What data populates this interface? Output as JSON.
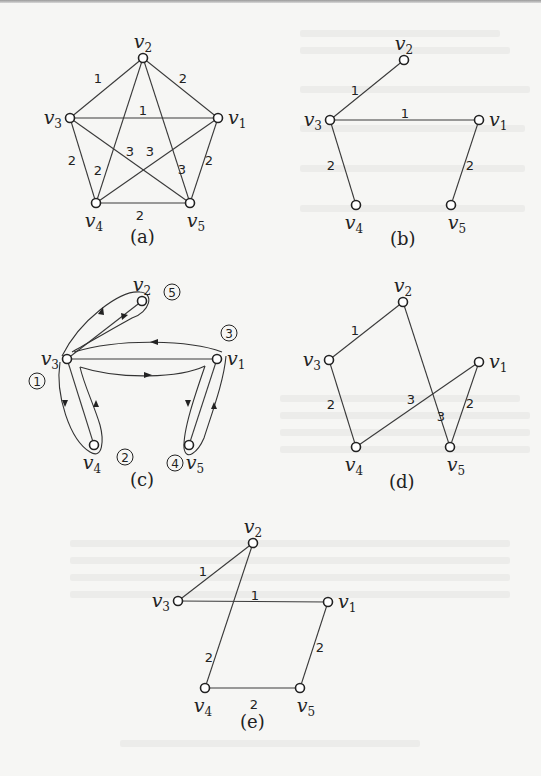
{
  "figure": {
    "panels": [
      {
        "id": "a",
        "caption": "(a)",
        "description": "Complete weighted graph K5",
        "nodes": [
          {
            "id": "v1",
            "label": "v",
            "sub": "1",
            "x": 218,
            "y": 118
          },
          {
            "id": "v2",
            "label": "v",
            "sub": "2",
            "x": 143,
            "y": 58
          },
          {
            "id": "v3",
            "label": "v",
            "sub": "3",
            "x": 70,
            "y": 118
          },
          {
            "id": "v4",
            "label": "v",
            "sub": "4",
            "x": 96,
            "y": 203
          },
          {
            "id": "v5",
            "label": "v",
            "sub": "5",
            "x": 190,
            "y": 203
          }
        ],
        "edges": [
          {
            "from": "v2",
            "to": "v3",
            "weight": "1"
          },
          {
            "from": "v2",
            "to": "v1",
            "weight": "2"
          },
          {
            "from": "v3",
            "to": "v1",
            "weight": "1"
          },
          {
            "from": "v3",
            "to": "v4",
            "weight": "2"
          },
          {
            "from": "v1",
            "to": "v5",
            "weight": "2"
          },
          {
            "from": "v4",
            "to": "v5",
            "weight": "2"
          },
          {
            "from": "v2",
            "to": "v4",
            "weight": "2"
          },
          {
            "from": "v2",
            "to": "v5",
            "weight": "3"
          },
          {
            "from": "v3",
            "to": "v5",
            "weight": "3"
          },
          {
            "from": "v1",
            "to": "v4",
            "weight": "3"
          }
        ]
      },
      {
        "id": "b",
        "caption": "(b)",
        "description": "Minimum spanning tree",
        "nodes": [
          {
            "id": "v1",
            "label": "v",
            "sub": "1",
            "x": 479,
            "y": 120
          },
          {
            "id": "v2",
            "label": "v",
            "sub": "2",
            "x": 404,
            "y": 60
          },
          {
            "id": "v3",
            "label": "v",
            "sub": "3",
            "x": 330,
            "y": 120
          },
          {
            "id": "v4",
            "label": "v",
            "sub": "4",
            "x": 356,
            "y": 205
          },
          {
            "id": "v5",
            "label": "v",
            "sub": "5",
            "x": 451,
            "y": 205
          }
        ],
        "edges": [
          {
            "from": "v3",
            "to": "v2",
            "weight": "1"
          },
          {
            "from": "v3",
            "to": "v1",
            "weight": "1"
          },
          {
            "from": "v3",
            "to": "v4",
            "weight": "2"
          },
          {
            "from": "v1",
            "to": "v5",
            "weight": "2"
          }
        ]
      },
      {
        "id": "c",
        "caption": "(c)",
        "description": "Euler tour around doubled spanning tree",
        "nodes": [
          {
            "id": "v1",
            "label": "v",
            "sub": "1",
            "x": 217,
            "y": 359
          },
          {
            "id": "v2",
            "label": "v",
            "sub": "2",
            "x": 142,
            "y": 301
          },
          {
            "id": "v3",
            "label": "v",
            "sub": "3",
            "x": 67,
            "y": 359
          },
          {
            "id": "v4",
            "label": "v",
            "sub": "4",
            "x": 94,
            "y": 445
          },
          {
            "id": "v5",
            "label": "v",
            "sub": "5",
            "x": 189,
            "y": 445
          }
        ],
        "edges": [
          {
            "from": "v3",
            "to": "v2",
            "weight": ""
          },
          {
            "from": "v3",
            "to": "v1",
            "weight": ""
          },
          {
            "from": "v3",
            "to": "v4",
            "weight": ""
          },
          {
            "from": "v1",
            "to": "v5",
            "weight": ""
          }
        ],
        "step_markers": [
          {
            "label": "1",
            "x": 37,
            "y": 381
          },
          {
            "label": "2",
            "x": 125,
            "y": 457
          },
          {
            "label": "3",
            "x": 229,
            "y": 333
          },
          {
            "label": "4",
            "x": 175,
            "y": 463
          },
          {
            "label": "5",
            "x": 172,
            "y": 292
          }
        ]
      },
      {
        "id": "d",
        "caption": "(d)",
        "description": "Hamiltonian cycle from shortcutting",
        "nodes": [
          {
            "id": "v1",
            "label": "v",
            "sub": "1",
            "x": 479,
            "y": 362
          },
          {
            "id": "v2",
            "label": "v",
            "sub": "2",
            "x": 403,
            "y": 302
          },
          {
            "id": "v3",
            "label": "v",
            "sub": "3",
            "x": 329,
            "y": 360
          },
          {
            "id": "v4",
            "label": "v",
            "sub": "4",
            "x": 356,
            "y": 447
          },
          {
            "id": "v5",
            "label": "v",
            "sub": "5",
            "x": 450,
            "y": 447
          }
        ],
        "edges": [
          {
            "from": "v3",
            "to": "v2",
            "weight": "1"
          },
          {
            "from": "v2",
            "to": "v5",
            "weight": "3"
          },
          {
            "from": "v5",
            "to": "v1",
            "weight": "2"
          },
          {
            "from": "v1",
            "to": "v4",
            "weight": "3"
          },
          {
            "from": "v4",
            "to": "v3",
            "weight": "2"
          }
        ]
      },
      {
        "id": "e",
        "caption": "(e)",
        "description": "Optimal tour",
        "nodes": [
          {
            "id": "v1",
            "label": "v",
            "sub": "1",
            "x": 328,
            "y": 602
          },
          {
            "id": "v2",
            "label": "v",
            "sub": "2",
            "x": 253,
            "y": 543
          },
          {
            "id": "v3",
            "label": "v",
            "sub": "3",
            "x": 178,
            "y": 601
          },
          {
            "id": "v4",
            "label": "v",
            "sub": "4",
            "x": 205,
            "y": 688
          },
          {
            "id": "v5",
            "label": "v",
            "sub": "5",
            "x": 300,
            "y": 688
          }
        ],
        "edges": [
          {
            "from": "v3",
            "to": "v2",
            "weight": "1"
          },
          {
            "from": "v3",
            "to": "v1",
            "weight": "1"
          },
          {
            "from": "v1",
            "to": "v5",
            "weight": "2"
          },
          {
            "from": "v5",
            "to": "v4",
            "weight": "2"
          },
          {
            "from": "v4",
            "to": "v2",
            "weight": "2"
          }
        ]
      }
    ]
  },
  "captions": {
    "a": "(a)",
    "b": "(b)",
    "c": "(c)",
    "d": "(d)",
    "e": "(e)"
  }
}
